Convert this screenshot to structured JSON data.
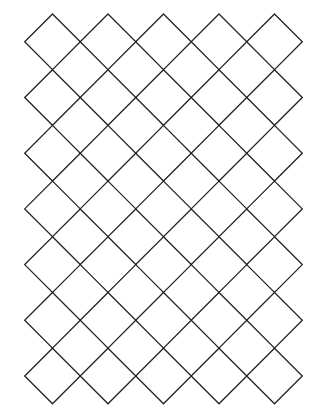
{
  "canvas": {
    "width": 320,
    "height": 419,
    "background": "#ffffff"
  },
  "grid": {
    "type": "diamond-lattice",
    "columns": 5,
    "rows": 7,
    "origin_x": 52.5,
    "origin_y": 41.8,
    "step_x": 55.5,
    "step_y": 55.7,
    "half_diagonal": 27.8,
    "stroke_color": "#222222",
    "stroke_width": 1.3
  }
}
